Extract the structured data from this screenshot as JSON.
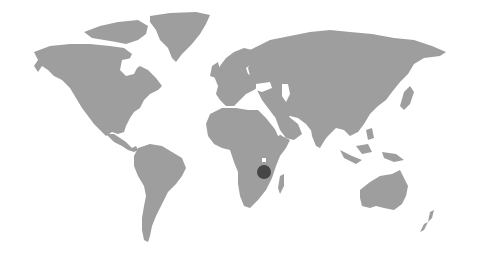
{
  "map": {
    "projection": "world",
    "background_color": "#ffffff",
    "land_color": "#9e9e9e",
    "marker": {
      "name": "location-marker",
      "color": "#474747",
      "x": 264,
      "y": 172,
      "r": 7,
      "region": "East Africa"
    },
    "continents": [
      "North America",
      "Greenland",
      "South America",
      "Europe",
      "Africa",
      "Asia",
      "Australia",
      "New Zealand",
      "Madagascar"
    ]
  }
}
